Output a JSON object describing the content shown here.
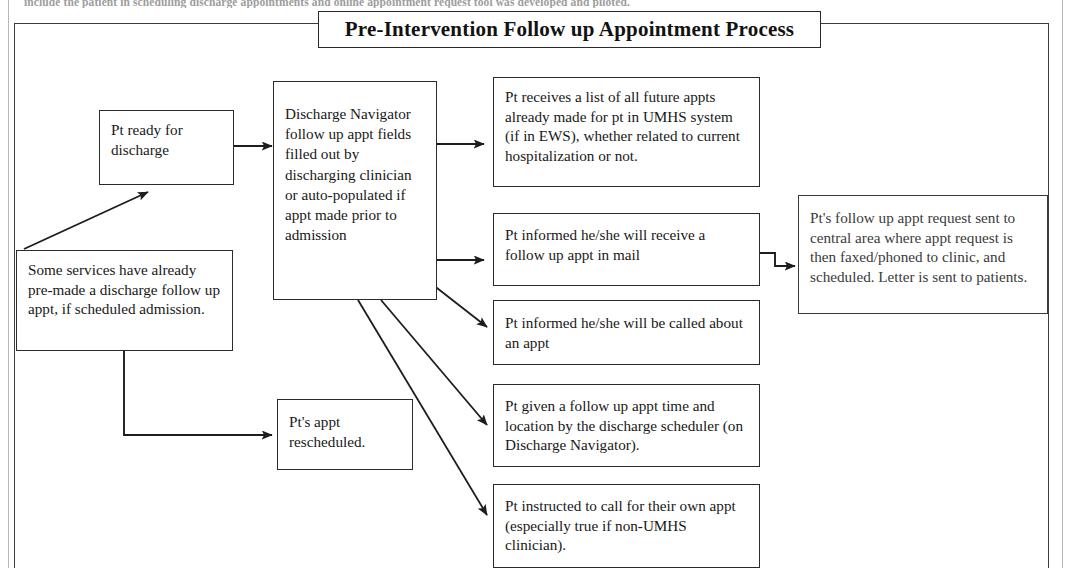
{
  "document": {
    "cut_off_header_text": "include the patient in scheduling discharge appointments and online appointment request tool was developed and piloted."
  },
  "diagram": {
    "title": "Pre-Intervention Follow up Appointment Process",
    "type": "flowchart",
    "nodes": [
      {
        "id": "pt-ready-for-discharge",
        "text": "Pt ready for discharge"
      },
      {
        "id": "some-services-pre-made",
        "text": "Some services have already pre-made a discharge follow up appt, if scheduled admission."
      },
      {
        "id": "discharge-navigator-fields",
        "text": "Discharge Navigator follow up appt fields filled out by discharging clinician or auto-populated if appt made prior to admission"
      },
      {
        "id": "pt-appt-rescheduled",
        "text": "Pt's appt rescheduled."
      },
      {
        "id": "pt-receives-list",
        "text": "Pt receives a list of all future appts already made for pt in UMHS system (if in EWS), whether related to current hospitalization or not."
      },
      {
        "id": "pt-informed-mail",
        "text": "Pt informed he/she will receive a follow up appt in mail"
      },
      {
        "id": "pt-informed-called",
        "text": "Pt informed he/she will be called about an appt"
      },
      {
        "id": "pt-given-time-location",
        "text": "Pt given a follow up appt time and location by the discharge scheduler (on Discharge Navigator)."
      },
      {
        "id": "pt-instructed-to-call",
        "text": "Pt instructed to call for their own appt (especially true if non-UMHS clinician)."
      },
      {
        "id": "pt-request-sent-central",
        "text": "Pt's follow up appt request sent to central area where appt request is then faxed/phoned to clinic, and scheduled.  Letter is sent to patients."
      }
    ],
    "edges": [
      {
        "from": "pt-ready-for-discharge",
        "to": "discharge-navigator-fields"
      },
      {
        "from": "some-services-pre-made",
        "to": "pt-ready-for-discharge"
      },
      {
        "from": "some-services-pre-made",
        "to": "pt-appt-rescheduled"
      },
      {
        "from": "discharge-navigator-fields",
        "to": "pt-receives-list"
      },
      {
        "from": "discharge-navigator-fields",
        "to": "pt-informed-mail"
      },
      {
        "from": "discharge-navigator-fields",
        "to": "pt-informed-called"
      },
      {
        "from": "discharge-navigator-fields",
        "to": "pt-given-time-location"
      },
      {
        "from": "discharge-navigator-fields",
        "to": "pt-instructed-to-call"
      },
      {
        "from": "pt-informed-mail",
        "to": "pt-request-sent-central"
      }
    ]
  },
  "colors": {
    "line": "#2b2b2b",
    "text": "#181818",
    "background": "#ffffff",
    "scan_artifact": "#b8b8b8"
  }
}
